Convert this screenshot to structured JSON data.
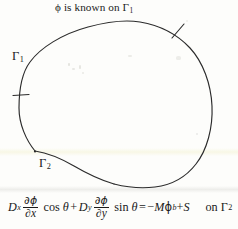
{
  "figure": {
    "title_caption": "ϕ is known on Γ",
    "title_caption_sub": "1",
    "boundary_labels": [
      {
        "name": "gamma-1",
        "symbol": "Γ",
        "subscript": "1"
      },
      {
        "name": "gamma-2",
        "symbol": "Γ",
        "subscript": "2"
      }
    ],
    "equation": {
      "d_x": "D",
      "d_x_sub": "x",
      "partial_phi": "∂ϕ",
      "partial_x": "∂x",
      "cos": "cos",
      "theta": "θ",
      "plus": "+",
      "d_y": "D",
      "d_y_sub": "y",
      "partial_phi_2": "∂ϕ",
      "partial_y": "∂y",
      "sin": "sin",
      "theta_2": "θ",
      "equals": "=",
      "minus": "−",
      "m": "M",
      "phi_b": "ϕ",
      "phi_b_sub": "b",
      "plus_2": "+",
      "s": "S",
      "condition": "on Γ",
      "condition_sub": "2"
    },
    "colors": {
      "ink": "#1a1a1a",
      "paper": "#fdfdfb",
      "curve": "#2b2b2b"
    }
  }
}
